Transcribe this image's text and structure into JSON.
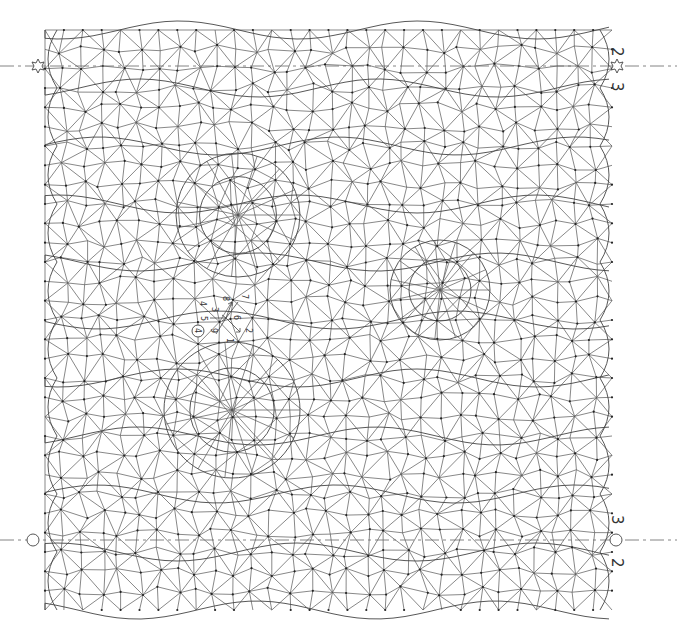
{
  "diagram": {
    "type": "bobbin lace pricking",
    "colors": {
      "line": "#555555",
      "pin": "#222222",
      "background": "#ffffff"
    },
    "bounds": {
      "left": 45,
      "top": 30,
      "right": 612,
      "bottom": 610
    },
    "repeat_lines": [
      {
        "y": 66,
        "left_marker": "star",
        "right_marker": "star",
        "labels": [
          {
            "text": "2",
            "x": 617,
            "y": 52
          },
          {
            "text": "3",
            "x": 617,
            "y": 86
          }
        ]
      },
      {
        "y": 540,
        "left_marker": "circle",
        "right_marker": "circle",
        "labels": [
          {
            "text": "3",
            "x": 617,
            "y": 521
          },
          {
            "text": "2",
            "x": 617,
            "y": 563
          }
        ]
      }
    ],
    "center_labels": [
      {
        "text": "4",
        "x": 203,
        "y": 305,
        "rot": 90
      },
      {
        "text": "5",
        "x": 205,
        "y": 320,
        "rot": 90
      },
      {
        "text": "3",
        "x": 215,
        "y": 310,
        "rot": 90
      },
      {
        "text": "8",
        "x": 226,
        "y": 300,
        "rot": 90
      },
      {
        "text": "7",
        "x": 245,
        "y": 297,
        "rot": 90
      },
      {
        "text": "6",
        "x": 237,
        "y": 318,
        "rot": 90
      },
      {
        "text": "9",
        "x": 214,
        "y": 331,
        "rot": 90
      },
      {
        "text": "2",
        "x": 249,
        "y": 331,
        "rot": 90
      },
      {
        "text": "1",
        "x": 230,
        "y": 341,
        "rot": 90
      }
    ],
    "circled_label": {
      "text": "4",
      "x": 198,
      "y": 331
    },
    "rosettes": [
      {
        "cx": 238,
        "cy": 215,
        "r": 62
      },
      {
        "cx": 232,
        "cy": 410,
        "r": 68
      },
      {
        "cx": 440,
        "cy": 290,
        "r": 50
      }
    ]
  }
}
